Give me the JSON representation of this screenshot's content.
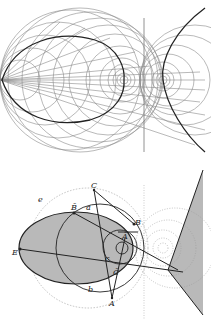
{
  "figure": {
    "top_panel": {
      "description": "Family of circles and rays from a focal point on the left, with an ellipse-like bold curve, a vertical axis, and a bold hyperbola branch on the right with concentric circles around two foci",
      "colors": {
        "thin_lines": "#8a8a8a",
        "bold_curve": "#222222",
        "background": "#ffffff"
      }
    },
    "bottom_panel": {
      "description": "Geometric construction: shaded ellipse, circles, triangle ABC, shaded hyperbolic region on the right",
      "labels": {
        "C": "C",
        "B_bar": "B̄",
        "B": "B",
        "A_bar": "Ā",
        "C_bar": "C̄",
        "A": "A",
        "E": "E",
        "e": "e",
        "b": "b",
        "a": "a",
        "c": "c"
      },
      "colors": {
        "shade": "#b9b9b9",
        "line": "#222222",
        "dotted": "#9a9a9a"
      }
    }
  }
}
